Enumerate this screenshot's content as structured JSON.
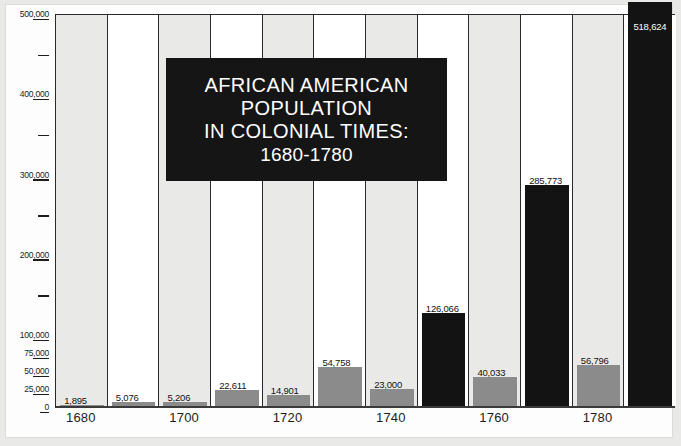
{
  "chart_data": {
    "type": "bar",
    "title": "AFRICAN AMERICAN POPULATION IN COLONIAL TIMES: 1680-1780",
    "title_lines": [
      "AFRICAN AMERICAN",
      "POPULATION",
      "IN COLONIAL TIMES:",
      "1680-1780"
    ],
    "xlabel": "",
    "ylabel": "",
    "ylim": [
      0,
      500000
    ],
    "grid": false,
    "legend": "none",
    "categories": [
      1680,
      1690,
      1700,
      1710,
      1720,
      1730,
      1740,
      1750,
      1760,
      1770,
      1780
    ],
    "values": [
      1895,
      5076,
      5206,
      22611,
      14901,
      54758,
      23000,
      126066,
      40033,
      285773,
      56796
    ],
    "value_labels": [
      "1,895",
      "5,076",
      "5,206",
      "22,611",
      "14,901",
      "54,758",
      "23,000",
      "126,066",
      "40,033",
      "285,773",
      "56,796"
    ],
    "extra_bar": {
      "label": "518,624",
      "value": 518624,
      "note": "final bar exceeds the 500,000 axis maximum"
    },
    "x_tick_labels": [
      "1680",
      "1700",
      "1720",
      "1740",
      "1760",
      "1780"
    ],
    "y_major_labels": [
      "500,000",
      "400,000",
      "300,000",
      "200,000",
      "100,000"
    ],
    "y_lower_labels": [
      "75,000",
      "50,000",
      "25,000",
      "0"
    ],
    "axis_note": "lower portion of the axis uses a compressed scale between 0 and 100,000",
    "colors": {
      "bar": "#131313",
      "bar_base": "#8b8b8b",
      "column_shade": "#e9e9e7",
      "column_plain": "#ffffff",
      "plaque": "#151515",
      "text": "#1c1c1c",
      "frame": "#e9e9e7"
    }
  }
}
